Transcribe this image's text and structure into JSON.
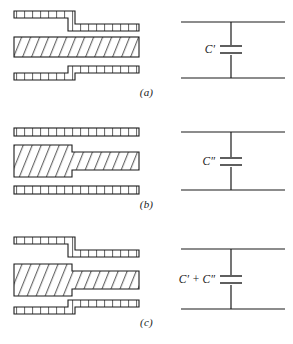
{
  "figure": {
    "background_color": "#ffffff",
    "line_color": "#1a1a1a",
    "hatch_color": "#3a3a3a"
  },
  "panels": [
    {
      "id": "panel-a",
      "caption": "(a)",
      "cross_section": {
        "description": "Outer conductor planes stepped, centre conductor straight",
        "stepped_layers": [
          "top-ground-plane",
          "bottom-ground-plane"
        ],
        "straight_layers": [
          "centre-conductor"
        ],
        "top_band_hatch": "ladder",
        "middle_band_hatch": "diagonal",
        "bottom_band_hatch": "ladder"
      },
      "circuit": {
        "component": "capacitor",
        "label": "C′",
        "topology": "shunt"
      }
    },
    {
      "id": "panel-b",
      "caption": "(b)",
      "cross_section": {
        "description": "Centre conductor stepped, outer ground planes straight",
        "stepped_layers": [
          "centre-conductor"
        ],
        "straight_layers": [
          "top-ground-plane",
          "bottom-ground-plane"
        ],
        "top_band_hatch": "ladder",
        "middle_band_hatch": "diagonal",
        "bottom_band_hatch": "ladder"
      },
      "circuit": {
        "component": "capacitor",
        "label": "C″",
        "topology": "shunt"
      }
    },
    {
      "id": "panel-c",
      "caption": "(c)",
      "cross_section": {
        "description": "Both outer planes and centre conductor stepped",
        "stepped_layers": [
          "top-ground-plane",
          "centre-conductor",
          "bottom-ground-plane"
        ],
        "straight_layers": [],
        "top_band_hatch": "ladder",
        "middle_band_hatch": "diagonal",
        "bottom_band_hatch": "ladder"
      },
      "circuit": {
        "component": "capacitor",
        "label": "C′ + C″",
        "topology": "shunt"
      }
    }
  ]
}
